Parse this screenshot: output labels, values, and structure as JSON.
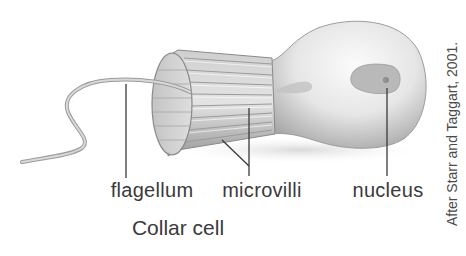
{
  "diagram": {
    "title": "Collar cell",
    "labels": {
      "flagellum": "flagellum",
      "microvilli": "microvilli",
      "nucleus": "nucleus"
    },
    "credit": "After Starr and Taggart, 2001.",
    "colors": {
      "background": "#ffffff",
      "ink": "#3a3a3a",
      "cell_light": "#f2f2f2",
      "cell_shade": "#a8a8a8",
      "nucleus": "#b5b5b5"
    }
  }
}
